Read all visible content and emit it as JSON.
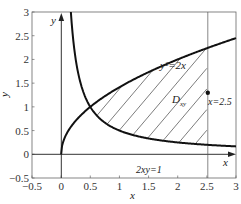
{
  "chart_data": {
    "type": "line",
    "title": "",
    "xlabel": "x",
    "ylabel": "y",
    "xlim": [
      -0.5,
      3
    ],
    "ylim": [
      -0.5,
      3
    ],
    "x_ticks": [
      "-0.5",
      "0",
      "0.5",
      "1",
      "1.5",
      "2",
      "2.5",
      "3"
    ],
    "y_ticks": [
      "-0.5",
      "0",
      "0.5",
      "1",
      "1.5",
      "2",
      "2.5",
      "3"
    ],
    "grid": false,
    "series": [
      {
        "name": "y^2=2x",
        "equation": "y = sqrt(2x)",
        "x": [
          0,
          0.5,
          1,
          1.5,
          2,
          2.5,
          3
        ],
        "values": [
          0,
          1,
          1.414,
          1.732,
          2,
          2.236,
          2.449
        ]
      },
      {
        "name": "2xy=1",
        "equation": "y = 1/(2x)",
        "x": [
          0.167,
          0.25,
          0.5,
          1,
          1.5,
          2,
          2.5,
          3
        ],
        "values": [
          3,
          2,
          1,
          0.5,
          0.333,
          0.25,
          0.2,
          0.167
        ]
      }
    ],
    "annotations": [
      {
        "text": "y²=2x",
        "x": 1.85,
        "y": 2.0
      },
      {
        "text": "2xy=1",
        "x": 1.3,
        "y": 0.25
      },
      {
        "text": "D_xy",
        "x": 1.9,
        "y": 1.6
      },
      {
        "text": "x=2.5",
        "x": 2.55,
        "y": 1.0
      },
      {
        "text": "y",
        "x": -0.1,
        "y": 2.8
      },
      {
        "text": "x",
        "x": 2.85,
        "y": -0.15
      }
    ],
    "vertical_line": {
      "x": 2.5,
      "label": "x=2.5"
    },
    "point": {
      "x": 2.5,
      "y": 1.3
    },
    "shaded_region": {
      "name": "D_xy",
      "bounds": "1/(2x) <= y <= sqrt(2x), x from 0.5 to 2.5",
      "style": "hatched"
    }
  },
  "labels": {
    "curve1": "y²=2x",
    "curve2": "2xy=1",
    "region_main": "D",
    "region_sub": "xy",
    "vline": "x=2.5",
    "yaxis_arrow": "y",
    "xaxis_arrow": "x",
    "xlabel": "x",
    "ylabel": "y"
  }
}
